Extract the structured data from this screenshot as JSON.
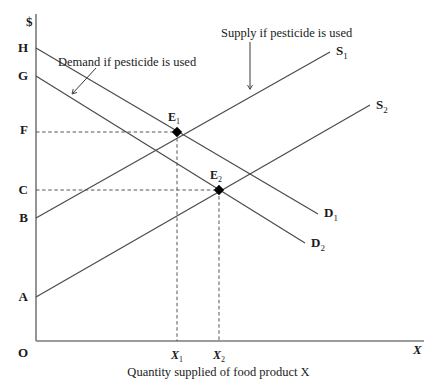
{
  "figure": {
    "caption": "Quantity supplied of food product X",
    "y_axis_title": "$",
    "x_axis_title": "X",
    "origin_label": "O"
  },
  "y_axis_values": [
    {
      "label": "H",
      "y": 48
    },
    {
      "label": "G",
      "y": 76
    },
    {
      "label": "F",
      "y": 130
    },
    {
      "label": "C",
      "y": 190
    },
    {
      "label": "B",
      "y": 218
    },
    {
      "label": "A",
      "y": 297
    }
  ],
  "x_axis_ticks": [
    {
      "label": "X",
      "sub": "1",
      "x": 177
    },
    {
      "label": "X",
      "sub": "2",
      "x": 219
    }
  ],
  "curves": [
    {
      "name": "S",
      "sub": "1",
      "type": "supply",
      "from": [
        36,
        218
      ],
      "to": [
        330,
        52
      ],
      "label_x": 336,
      "label_y": 44
    },
    {
      "name": "S",
      "sub": "2",
      "type": "supply",
      "from": [
        36,
        297
      ],
      "to": [
        370,
        105
      ],
      "label_x": 376,
      "label_y": 98
    },
    {
      "name": "D",
      "sub": "1",
      "type": "demand",
      "from": [
        36,
        48
      ],
      "to": [
        318,
        214
      ],
      "label_x": 324,
      "label_y": 206
    },
    {
      "name": "D",
      "sub": "2",
      "type": "demand",
      "from": [
        36,
        76
      ],
      "to": [
        305,
        243
      ],
      "label_x": 311,
      "label_y": 236
    }
  ],
  "equilibria": [
    {
      "name": "E",
      "sub": "1",
      "x": 177,
      "y": 132,
      "price_label": "F",
      "quantity_label": "X1",
      "label_x": 168,
      "label_y": 111
    },
    {
      "name": "E",
      "sub": "2",
      "x": 219,
      "y": 190,
      "price_label": "C",
      "quantity_label": "X2",
      "label_x": 210,
      "label_y": 169
    }
  ],
  "annotations": [
    {
      "text": "Demand if pesticide is used",
      "x": 58,
      "y": 56,
      "arrow_from": [
        96,
        68
      ],
      "arrow_to": [
        73,
        93
      ]
    },
    {
      "text": "Supply if pesticide is used",
      "x": 221,
      "y": 27,
      "arrow_from": [
        250,
        42
      ],
      "arrow_to": [
        250,
        88
      ]
    }
  ],
  "colors": {
    "line": "#4a4a4a",
    "text": "#1a1a1a",
    "dashed": "#555555",
    "marker": "#000000"
  }
}
